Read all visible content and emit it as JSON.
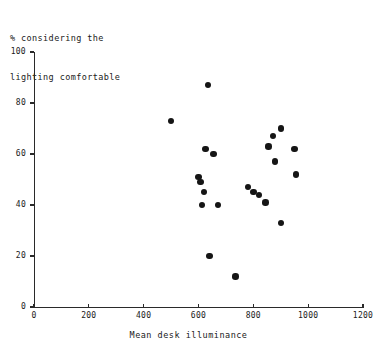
{
  "chart_data": {
    "type": "scatter",
    "title": "",
    "ylabel": "% considering the\nlighting comfortable",
    "xlabel": "Mean desk illuminance",
    "xlim": [
      0,
      1200
    ],
    "ylim": [
      0,
      100
    ],
    "xticks": [
      0,
      200,
      400,
      600,
      800,
      1000,
      1200
    ],
    "yticks": [
      0,
      20,
      40,
      60,
      80,
      100
    ],
    "grid": false,
    "legend": "none",
    "marker": "filled-circle",
    "marker_color": "#151515",
    "points": [
      {
        "x": 500,
        "y": 73
      },
      {
        "x": 635,
        "y": 87
      },
      {
        "x": 625,
        "y": 62
      },
      {
        "x": 600,
        "y": 51
      },
      {
        "x": 607,
        "y": 49
      },
      {
        "x": 620,
        "y": 45
      },
      {
        "x": 612,
        "y": 40
      },
      {
        "x": 655,
        "y": 60
      },
      {
        "x": 672,
        "y": 40
      },
      {
        "x": 640,
        "y": 20
      },
      {
        "x": 735,
        "y": 12
      },
      {
        "x": 780,
        "y": 47
      },
      {
        "x": 800,
        "y": 45
      },
      {
        "x": 820,
        "y": 44
      },
      {
        "x": 845,
        "y": 41
      },
      {
        "x": 855,
        "y": 63
      },
      {
        "x": 872,
        "y": 67
      },
      {
        "x": 880,
        "y": 57
      },
      {
        "x": 900,
        "y": 70
      },
      {
        "x": 900,
        "y": 33
      },
      {
        "x": 950,
        "y": 62
      },
      {
        "x": 955,
        "y": 52
      }
    ]
  },
  "axes": {
    "y_label_line1": "% considering the",
    "y_label_line2": "lighting comfortable",
    "x_title": "Mean desk illuminance"
  }
}
